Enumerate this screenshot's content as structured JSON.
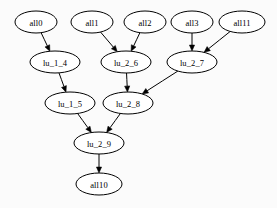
{
  "graph": {
    "title": "dependency graph",
    "type": "directed-acyclic-graph",
    "layout": "top-down",
    "background_color": "#fbfbfb",
    "node_fill": "#ffffff",
    "node_stroke": "#000000",
    "edge_color": "#000000",
    "node_shape": "ellipse",
    "node_count": 11,
    "edge_count": 10,
    "nodes": [
      {
        "id": "all0",
        "label": "all0",
        "cx": 36,
        "cy": 22,
        "rx": 21,
        "ry": 11
      },
      {
        "id": "all1",
        "label": "all1",
        "cx": 92,
        "cy": 22,
        "rx": 21,
        "ry": 11
      },
      {
        "id": "all2",
        "label": "all2",
        "cx": 145,
        "cy": 22,
        "rx": 21,
        "ry": 11
      },
      {
        "id": "all3",
        "label": "all3",
        "cx": 192,
        "cy": 22,
        "rx": 21,
        "ry": 11
      },
      {
        "id": "all11",
        "label": "all11",
        "cx": 242,
        "cy": 22,
        "rx": 23,
        "ry": 11
      },
      {
        "id": "lu_1_4",
        "label": "lu_1_4",
        "cx": 55,
        "cy": 62,
        "rx": 25,
        "ry": 11
      },
      {
        "id": "lu_2_6",
        "label": "lu_2_6",
        "cx": 126,
        "cy": 62,
        "rx": 25,
        "ry": 11
      },
      {
        "id": "lu_2_7",
        "label": "lu_2_7",
        "cx": 192,
        "cy": 62,
        "rx": 25,
        "ry": 11
      },
      {
        "id": "lu_1_5",
        "label": "lu_1_5",
        "cx": 70,
        "cy": 103,
        "rx": 25,
        "ry": 11
      },
      {
        "id": "lu_2_8",
        "label": "lu_2_8",
        "cx": 128,
        "cy": 103,
        "rx": 25,
        "ry": 11
      },
      {
        "id": "lu_2_9",
        "label": "lu_2_9",
        "cx": 99,
        "cy": 143,
        "rx": 25,
        "ry": 11
      },
      {
        "id": "all10",
        "label": "all10",
        "cx": 99,
        "cy": 184,
        "rx": 23,
        "ry": 11
      }
    ],
    "edges": [
      {
        "from": "all0",
        "to": "lu_1_4"
      },
      {
        "from": "all1",
        "to": "lu_2_6"
      },
      {
        "from": "all2",
        "to": "lu_2_6"
      },
      {
        "from": "all3",
        "to": "lu_2_7"
      },
      {
        "from": "all11",
        "to": "lu_2_7"
      },
      {
        "from": "lu_1_4",
        "to": "lu_1_5"
      },
      {
        "from": "lu_2_6",
        "to": "lu_2_8"
      },
      {
        "from": "lu_2_7",
        "to": "lu_2_8"
      },
      {
        "from": "lu_1_5",
        "to": "lu_2_9"
      },
      {
        "from": "lu_2_8",
        "to": "lu_2_9"
      },
      {
        "from": "lu_2_9",
        "to": "all10"
      }
    ]
  }
}
